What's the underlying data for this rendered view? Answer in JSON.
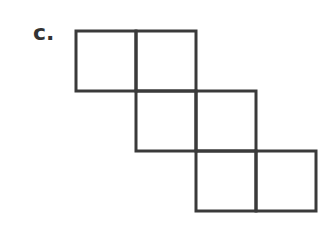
{
  "label": "c.",
  "diagram": {
    "type": "net-of-squares",
    "square_count": 6,
    "cell_size_px": 60,
    "stroke_color": "#3a3a3a",
    "cells": [
      {
        "row": 0,
        "col": 0
      },
      {
        "row": 0,
        "col": 1
      },
      {
        "row": 1,
        "col": 1
      },
      {
        "row": 1,
        "col": 2
      },
      {
        "row": 2,
        "col": 2
      },
      {
        "row": 2,
        "col": 3
      }
    ]
  }
}
